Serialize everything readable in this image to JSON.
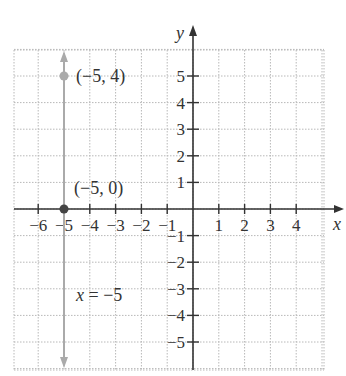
{
  "chart_data": {
    "type": "line",
    "title": "",
    "xlabel": "x",
    "ylabel": "y",
    "xlim": [
      -7,
      5
    ],
    "ylim": [
      -6,
      6
    ],
    "grid": true,
    "x_ticks": [
      -6,
      -5,
      -4,
      -3,
      -2,
      -1,
      1,
      2,
      3,
      4
    ],
    "x_tick_labels": [
      "−6",
      "−5",
      "−4",
      "−3",
      "−2",
      "−1",
      "1",
      "2",
      "3",
      "4"
    ],
    "y_ticks": [
      5,
      4,
      3,
      2,
      1,
      -1,
      -2,
      -3,
      -4,
      -5
    ],
    "y_tick_labels": [
      "5",
      "4",
      "3",
      "2",
      "1",
      "−1",
      "−2",
      "−3",
      "−4",
      "−5"
    ],
    "series": [
      {
        "name": "x = −5",
        "kind": "vertical-line",
        "x": -5,
        "color": "#aaaaaa",
        "arrows": "both"
      }
    ],
    "points": [
      {
        "label": "(−5, 4)",
        "x": -5,
        "y": 4,
        "plotted_at_y": 5,
        "color": "#aaaaaa"
      },
      {
        "label": "(−5, 0)",
        "x": -5,
        "y": 0,
        "color": "#444444"
      }
    ],
    "annotations": [
      {
        "text": "x = −5",
        "x": -4.3,
        "y": -3.5
      }
    ]
  },
  "labels": {
    "point_top": "(−5, 4)",
    "point_origin": "(−5, 0)",
    "line_equation": "x = −5",
    "x_axis": "x",
    "y_axis": "y"
  }
}
